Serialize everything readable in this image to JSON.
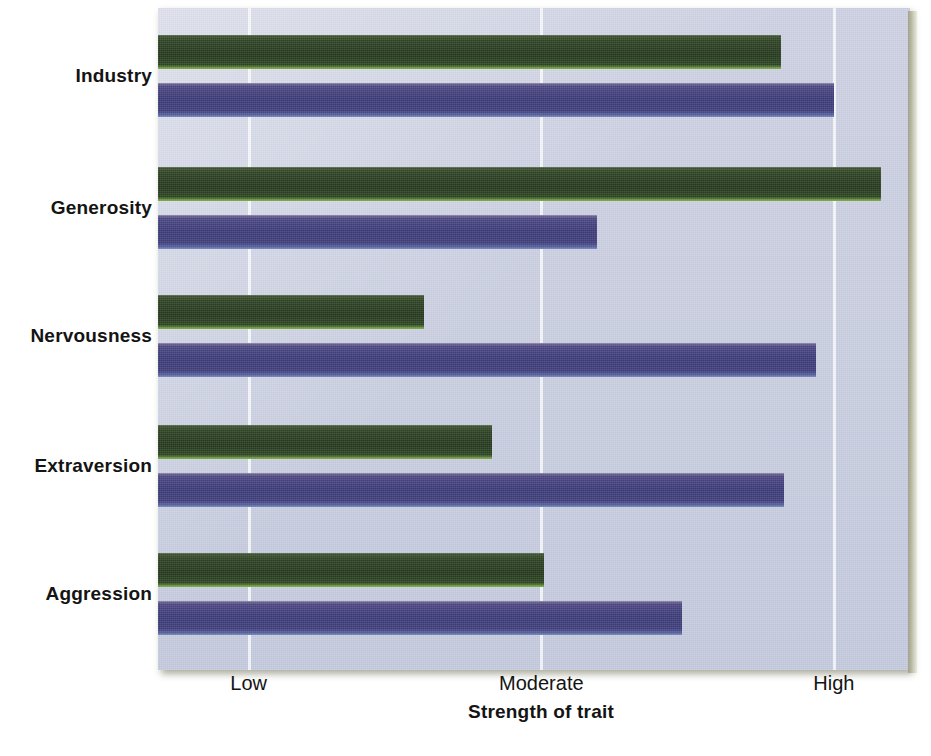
{
  "chart_data": {
    "type": "bar",
    "orientation": "horizontal",
    "title": "",
    "subtitle": "",
    "xlabel": "Strength of trait",
    "ylabel": "",
    "categories": [
      "Industry",
      "Generosity",
      "Nervousness",
      "Extraversion",
      "Aggression"
    ],
    "tick_labels": [
      "Low",
      "Moderate",
      "High"
    ],
    "tick_values": [
      1,
      2,
      3
    ],
    "xlim": [
      0.69,
      3.26
    ],
    "grid": true,
    "legend": "none",
    "series": [
      {
        "name": "green-series",
        "color": "#2d4123",
        "values": [
          2.82,
          3.16,
          1.6,
          1.83,
          2.01
        ]
      },
      {
        "name": "purple-series",
        "color": "#3b3a76",
        "values": [
          3.0,
          2.19,
          2.94,
          2.83,
          2.48
        ]
      }
    ],
    "colors": {
      "green_bar": "#2d4123",
      "green_bar_highlight": "#86b24b",
      "purple_bar": "#3b3a76",
      "purple_bar_highlight": "#7e92c4",
      "panel_background": "#ccd0e2",
      "gridline": "#ffffff",
      "text": "#141414"
    }
  }
}
